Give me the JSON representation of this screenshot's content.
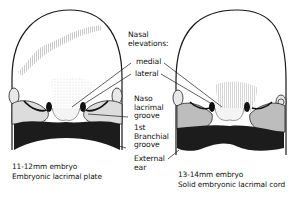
{
  "figure": {
    "labels": {
      "nasal_elevations": "Nasal",
      "nasal_elevations_2": "elevations:",
      "medial": "medial",
      "lateral": "lateral",
      "nasolacrimal_1": "Naso",
      "nasolacrimal_2": "lacrimal",
      "nasolacrimal_3": "groove",
      "branchial_1": "1st",
      "branchial_2": "Branchial",
      "branchial_3": "groove",
      "ear_1": "External",
      "ear_2": "ear"
    },
    "panels": [
      {
        "caption_line1": "11-12mm embryo",
        "caption_line2": "Embryonic lacrimal plate"
      },
      {
        "caption_line1": "13-14mm embryo",
        "caption_line2": "Solid embryonic lacrimal cord"
      }
    ],
    "colors": {
      "outline": "#1a1a1a",
      "dark_region": "#1c1c1c",
      "gray_region": "#bdbdbd",
      "light_region": "#eeeeee"
    }
  }
}
